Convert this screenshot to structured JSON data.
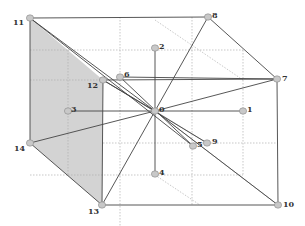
{
  "diagram": {
    "type": "3d-cube-graph",
    "colors": {
      "edge_main": "#444444",
      "edge_light": "#999999",
      "edge_dotted": "#b0b0b0",
      "shaded_face": "#d3d3d3",
      "node_fill": "#c8c8c8",
      "node_stroke": "#888888",
      "label": "#333333"
    },
    "nodes": [
      {
        "id": "0",
        "label": "0",
        "x": 155,
        "y": 111,
        "lx": 4,
        "ly": 1
      },
      {
        "id": "1",
        "label": "1",
        "x": 243,
        "y": 111,
        "lx": 4,
        "ly": 1
      },
      {
        "id": "2",
        "label": "2",
        "x": 155,
        "y": 48,
        "lx": 4,
        "ly": 1
      },
      {
        "id": "3",
        "label": "3",
        "x": 68,
        "y": 111,
        "lx": 3,
        "ly": 1
      },
      {
        "id": "4",
        "label": "4",
        "x": 155,
        "y": 174,
        "lx": 4,
        "ly": 1
      },
      {
        "id": "5",
        "label": "5",
        "x": 193,
        "y": 146,
        "lx": 4,
        "ly": 1
      },
      {
        "id": "6",
        "label": "6",
        "x": 120,
        "y": 77,
        "lx": 4,
        "ly": 0
      },
      {
        "id": "7",
        "label": "7",
        "x": 277,
        "y": 79,
        "lx": 5,
        "ly": 2
      },
      {
        "id": "8",
        "label": "8",
        "x": 208,
        "y": 17,
        "lx": 4,
        "ly": 1
      },
      {
        "id": "9",
        "label": "9",
        "x": 207,
        "y": 143,
        "lx": 5,
        "ly": 1
      },
      {
        "id": "10",
        "label": "10",
        "x": 278,
        "y": 205,
        "lx": 5,
        "ly": 2
      },
      {
        "id": "11",
        "label": "11",
        "x": 30,
        "y": 18,
        "lx": -17,
        "ly": 7
      },
      {
        "id": "12",
        "label": "12",
        "x": 103,
        "y": 80,
        "lx": -16,
        "ly": 8
      },
      {
        "id": "13",
        "label": "13",
        "x": 102,
        "y": 205,
        "lx": -14,
        "ly": 9
      },
      {
        "id": "14",
        "label": "14",
        "x": 30,
        "y": 143,
        "lx": -16,
        "ly": 8
      }
    ],
    "shaded_face": [
      "11",
      "12",
      "13",
      "14"
    ],
    "edges_main": [
      [
        "11",
        "8"
      ],
      [
        "8",
        "7"
      ],
      [
        "12",
        "7"
      ],
      [
        "7",
        "10"
      ],
      [
        "13",
        "10"
      ],
      [
        "11",
        "14"
      ],
      [
        "14",
        "13"
      ],
      [
        "12",
        "13"
      ],
      [
        "2",
        "4"
      ],
      [
        "3",
        "1"
      ],
      [
        "6",
        "7"
      ],
      [
        "11",
        "0"
      ],
      [
        "11",
        "5"
      ],
      [
        "12",
        "9"
      ],
      [
        "6",
        "5"
      ],
      [
        "0",
        "8"
      ],
      [
        "0",
        "7"
      ],
      [
        "0",
        "10"
      ],
      [
        "0",
        "13"
      ],
      [
        "14",
        "0"
      ],
      [
        "12",
        "0"
      ]
    ],
    "edges_light": [
      [
        "0",
        "9"
      ],
      [
        "0",
        "10"
      ]
    ],
    "edges_dotted": [
      [
        68,
        50,
        68,
        175
      ],
      [
        68,
        50,
        243,
        50
      ],
      [
        243,
        50,
        243,
        175
      ],
      [
        68,
        175,
        243,
        175
      ],
      [
        120,
        17,
        120,
        270
      ],
      [
        30,
        50,
        68,
        50
      ],
      [
        192,
        17,
        192,
        205
      ],
      [
        155,
        20,
        243,
        80
      ],
      [
        155,
        175,
        200,
        205
      ],
      [
        30,
        175,
        68,
        175
      ],
      [
        30,
        80,
        103,
        80
      ],
      [
        103,
        143,
        277,
        143
      ]
    ]
  }
}
